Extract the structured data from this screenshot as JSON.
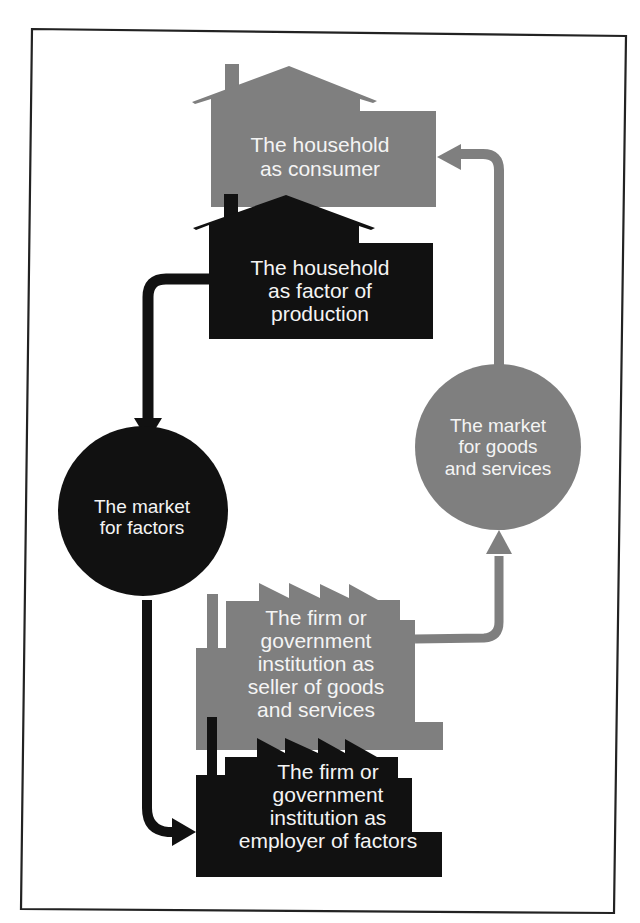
{
  "diagram": {
    "type": "circular-flow",
    "colors": {
      "gray": "#7f7f7f",
      "black": "#111111",
      "text": "#f4f4f4",
      "frame": "#222222",
      "background": "#ffffff"
    },
    "nodes": {
      "household_consumer": {
        "label": "The household\nas consumer",
        "shape": "house",
        "fill": "gray"
      },
      "household_factor": {
        "label": "The household\nas factor of\nproduction",
        "shape": "house",
        "fill": "black"
      },
      "market_goods": {
        "label": "The market\nfor goods\nand services",
        "shape": "circle",
        "fill": "gray"
      },
      "market_factors": {
        "label": "The market\nfor factors",
        "shape": "circle",
        "fill": "black"
      },
      "firm_seller": {
        "label": "The firm or\ngovernment\ninstitution as\nseller of goods\nand services",
        "shape": "factory",
        "fill": "gray"
      },
      "firm_employer": {
        "label": "The firm or\ngovernment\ninstitution as\nemployer of factors",
        "shape": "factory",
        "fill": "black"
      }
    },
    "edges": [
      {
        "from": "household_factor",
        "to": "market_factors",
        "color": "black"
      },
      {
        "from": "market_factors",
        "to": "firm_employer",
        "color": "black"
      },
      {
        "from": "firm_seller",
        "to": "market_goods",
        "color": "gray"
      },
      {
        "from": "market_goods",
        "to": "household_consumer",
        "color": "gray"
      }
    ]
  }
}
